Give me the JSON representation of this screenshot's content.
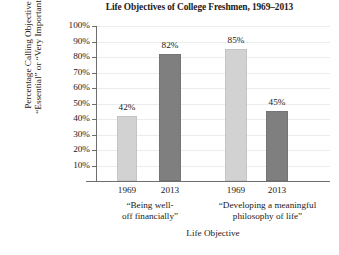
{
  "chart_data": {
    "type": "bar",
    "title": "Life Objectives of College Freshmen, 1969–2013",
    "xlabel": "Life Objective",
    "ylabel_line1": "Percentage Calling Objective",
    "ylabel_line2": "“Essential” or “Very Important”",
    "ylim": [
      0,
      100
    ],
    "yticks": [
      "100%",
      "90%",
      "80%",
      "70%",
      "60%",
      "50%",
      "40%",
      "30%",
      "20%",
      "10%"
    ],
    "ytick_values": [
      100,
      90,
      80,
      70,
      60,
      50,
      40,
      30,
      20,
      10
    ],
    "grid": true,
    "legend": "none",
    "categories": [
      "1969",
      "2013",
      "1969",
      "2013"
    ],
    "values": [
      42,
      82,
      85,
      45
    ],
    "value_labels": [
      "42%",
      "82%",
      "85%",
      "45%"
    ],
    "bar_styles": [
      "light",
      "dark",
      "light",
      "dark"
    ],
    "groups": [
      {
        "label_line1": "“Being well-",
        "label_line2": "off financially”",
        "bars": [
          {
            "category": "1969",
            "value": 42,
            "label": "42%",
            "style": "light"
          },
          {
            "category": "2013",
            "value": 82,
            "label": "82%",
            "style": "dark"
          }
        ]
      },
      {
        "label_line1": "“Developing a meaningful",
        "label_line2": "philosophy of life”",
        "bars": [
          {
            "category": "1969",
            "value": 85,
            "label": "85%",
            "style": "light"
          },
          {
            "category": "2013",
            "value": 45,
            "label": "45%",
            "style": "dark"
          }
        ]
      }
    ],
    "colors": {
      "light_bar": "#d2d2d2",
      "dark_bar": "#7f7f7f",
      "gridline": "#ececec",
      "axis": "#6e6e6e",
      "text": "#1a1a1a",
      "background": "#ffffff"
    }
  }
}
